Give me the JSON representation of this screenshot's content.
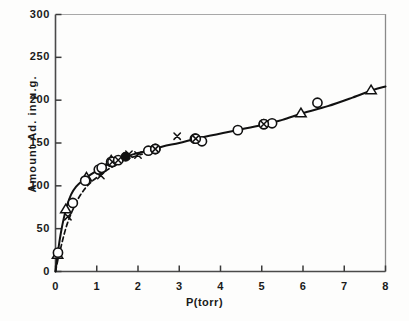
{
  "chart_data": {
    "type": "scatter",
    "title": "",
    "xlabel": "P(torr)",
    "ylabel": "Amount Ad. in  μ.g.",
    "xlim": [
      0,
      8
    ],
    "ylim": [
      0,
      300
    ],
    "xticks": [
      "0",
      "1",
      "2",
      "3",
      "4",
      "5",
      "6",
      "7",
      "8"
    ],
    "yticks": [
      "0",
      "50",
      "100",
      "150",
      "200",
      "250",
      "300"
    ],
    "grid": false,
    "legend_position": "none",
    "series": [
      {
        "name": "open-circle",
        "marker": "circle-open",
        "points": [
          [
            0.06,
            22
          ],
          [
            0.42,
            80
          ],
          [
            0.72,
            106
          ],
          [
            1.05,
            119
          ],
          [
            1.12,
            121
          ],
          [
            1.35,
            128
          ],
          [
            2.25,
            141
          ],
          [
            2.42,
            143
          ],
          [
            3.38,
            155
          ],
          [
            3.55,
            152
          ],
          [
            4.42,
            165
          ],
          [
            5.05,
            172
          ],
          [
            5.25,
            173
          ],
          [
            6.35,
            197
          ]
        ]
      },
      {
        "name": "open-triangle",
        "marker": "triangle-open",
        "points": [
          [
            0.05,
            20
          ],
          [
            0.25,
            73
          ],
          [
            0.75,
            110
          ],
          [
            1.35,
            130
          ],
          [
            5.95,
            185
          ],
          [
            7.65,
            212
          ]
        ]
      },
      {
        "name": "cross",
        "marker": "x",
        "points": [
          [
            0.3,
            64
          ],
          [
            1.1,
            112
          ],
          [
            1.78,
            137
          ],
          [
            2.0,
            136
          ],
          [
            2.95,
            158
          ]
        ]
      },
      {
        "name": "circled-cross",
        "marker": "circle-x",
        "points": [
          [
            1.38,
            128
          ],
          [
            1.52,
            130
          ],
          [
            2.42,
            143
          ],
          [
            3.4,
            155
          ],
          [
            5.05,
            172
          ]
        ]
      },
      {
        "name": "filled-circle",
        "marker": "circle-filled",
        "points": [
          [
            1.7,
            134
          ]
        ]
      }
    ],
    "curves": [
      {
        "name": "solid-isotherm",
        "style": "solid",
        "points": [
          [
            0.0,
            0
          ],
          [
            0.04,
            16
          ],
          [
            0.08,
            30
          ],
          [
            0.13,
            45
          ],
          [
            0.2,
            62
          ],
          [
            0.28,
            77
          ],
          [
            0.38,
            90
          ],
          [
            0.5,
            99
          ],
          [
            0.65,
            106
          ],
          [
            0.85,
            113
          ],
          [
            1.05,
            119
          ],
          [
            1.3,
            126
          ],
          [
            1.6,
            132
          ],
          [
            1.9,
            137
          ],
          [
            2.25,
            141
          ],
          [
            2.6,
            146
          ],
          [
            3.0,
            150
          ],
          [
            3.4,
            155
          ],
          [
            3.9,
            160
          ],
          [
            4.4,
            165
          ],
          [
            5.0,
            171
          ],
          [
            5.5,
            177
          ],
          [
            6.0,
            185
          ],
          [
            6.6,
            193
          ],
          [
            7.2,
            203
          ],
          [
            7.7,
            212
          ],
          [
            8.0,
            216
          ]
        ]
      },
      {
        "name": "dashed-isotherm",
        "style": "dashed",
        "points": [
          [
            0.0,
            0
          ],
          [
            0.05,
            12
          ],
          [
            0.1,
            22
          ],
          [
            0.18,
            38
          ],
          [
            0.28,
            55
          ],
          [
            0.4,
            70
          ],
          [
            0.55,
            85
          ],
          [
            0.72,
            97
          ],
          [
            0.9,
            106
          ],
          [
            1.1,
            113
          ],
          [
            1.3,
            120
          ],
          [
            1.5,
            125
          ],
          [
            1.7,
            130
          ],
          [
            1.9,
            134
          ],
          [
            2.1,
            137
          ]
        ]
      }
    ]
  }
}
